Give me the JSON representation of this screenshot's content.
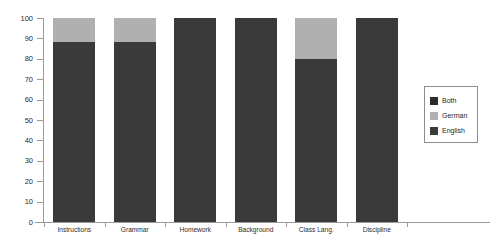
{
  "chart_data": {
    "type": "bar",
    "stacked": true,
    "title": "",
    "subtitle": "",
    "xlabel": "",
    "ylabel": "",
    "ylim": [
      0,
      100
    ],
    "yticks": [
      0,
      10,
      20,
      30,
      40,
      50,
      60,
      70,
      80,
      90,
      100
    ],
    "grid": false,
    "legend_position": "right",
    "categories": [
      "Instructions",
      "Grammar",
      "Homework",
      "Background",
      "Class Lang.",
      "Discipline"
    ],
    "series": [
      {
        "name": "English",
        "color": "#3a3a3a",
        "values": [
          88,
          88,
          100,
          100,
          80,
          100
        ]
      },
      {
        "name": "German",
        "color": "#b0b0b0",
        "values": [
          12,
          12,
          0,
          0,
          20,
          0
        ]
      },
      {
        "name": "Both",
        "color": "#2b2b2b",
        "values": [
          0,
          0,
          0,
          0,
          0,
          0
        ]
      }
    ],
    "legend": [
      {
        "label": "Both",
        "color": "#2b2b2b"
      },
      {
        "label": "German",
        "color": "#b0b0b0"
      },
      {
        "label": "English",
        "color": "#3a3a3a"
      }
    ],
    "axis_color": "#9a9a9a",
    "background": "#ffffff"
  }
}
